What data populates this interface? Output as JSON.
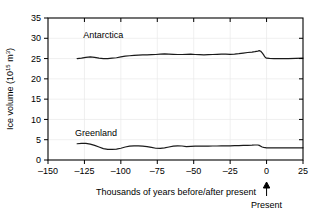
{
  "chart_data": {
    "type": "line",
    "title": "",
    "subtitle": "",
    "xlabel": "Thousands of years before/after present",
    "ylabel_prefix": "Ice volume (10",
    "ylabel_exponent": "15",
    "ylabel_suffix": " m",
    "ylabel_unit_exponent": "3",
    "ylabel_close": ")",
    "ylabel_full": "Ice volume (10^15 m^3)",
    "xlim": [
      -150,
      25
    ],
    "ylim": [
      0,
      35
    ],
    "xticks": [
      -150,
      -125,
      -100,
      -75,
      -50,
      -25,
      0,
      25
    ],
    "xtick_labels": [
      "–150",
      "–125",
      "–100",
      "–75",
      "–50",
      "–25",
      "0",
      "25"
    ],
    "yticks": [
      0,
      5,
      10,
      15,
      20,
      25,
      30,
      35
    ],
    "ytick_labels": [
      "0",
      "5",
      "10",
      "15",
      "20",
      "25",
      "30",
      "35"
    ],
    "grid": true,
    "grid_color": "#e8e8e8",
    "legend_position": "inline-labels",
    "line_color": "#1a1a1a",
    "annotations": [
      {
        "name": "present-marker",
        "label": "Present",
        "x": 0,
        "type": "up-arrow-below-axis"
      }
    ],
    "series": [
      {
        "name": "Antarctica",
        "label": "Antarctica",
        "label_x": -112,
        "label_y": 30,
        "x": [
          -130,
          -127,
          -124,
          -121,
          -118,
          -115,
          -112,
          -109,
          -106,
          -103,
          -100,
          -97,
          -94,
          -91,
          -88,
          -85,
          -82,
          -79,
          -76,
          -73,
          -70,
          -67,
          -64,
          -61,
          -58,
          -55,
          -52,
          -49,
          -46,
          -43,
          -40,
          -37,
          -34,
          -31,
          -28,
          -25,
          -22,
          -19,
          -16,
          -13,
          -10,
          -8,
          -6,
          -5,
          -4,
          -3,
          -2,
          -1.5,
          -1,
          -0.5,
          0,
          2,
          5,
          10,
          15,
          20,
          25
        ],
        "y": [
          25.0,
          25.1,
          25.3,
          25.4,
          25.3,
          25.1,
          25.0,
          25.0,
          25.1,
          25.2,
          25.4,
          25.6,
          25.7,
          25.8,
          25.85,
          25.9,
          25.9,
          25.95,
          26.0,
          26.1,
          26.15,
          26.1,
          26.05,
          26.0,
          26.0,
          26.05,
          26.1,
          26.0,
          25.95,
          25.9,
          25.95,
          26.0,
          26.05,
          26.1,
          26.1,
          26.05,
          26.1,
          26.2,
          26.35,
          26.5,
          26.6,
          26.7,
          26.85,
          26.95,
          26.8,
          26.4,
          25.9,
          25.6,
          25.35,
          25.2,
          25.1,
          25.05,
          25.0,
          25.0,
          25.0,
          25.05,
          25.1
        ]
      },
      {
        "name": "Greenland",
        "label": "Greenland",
        "label_x": -117,
        "label_y": 6.0,
        "x": [
          -130,
          -127,
          -124,
          -121,
          -118,
          -115,
          -112,
          -109,
          -106,
          -103,
          -100,
          -97,
          -94,
          -91,
          -88,
          -85,
          -82,
          -79,
          -76,
          -73,
          -70,
          -67,
          -64,
          -61,
          -58,
          -55,
          -52,
          -49,
          -46,
          -43,
          -40,
          -37,
          -34,
          -31,
          -28,
          -25,
          -22,
          -19,
          -16,
          -13,
          -10,
          -8,
          -6,
          -5,
          -4,
          -3,
          -2,
          -1,
          0,
          3,
          6,
          10,
          15,
          20,
          25
        ],
        "y": [
          4.0,
          4.1,
          4.1,
          3.9,
          3.6,
          3.2,
          2.8,
          2.6,
          2.6,
          2.7,
          2.9,
          3.2,
          3.4,
          3.5,
          3.5,
          3.4,
          3.3,
          3.1,
          2.9,
          2.85,
          3.0,
          3.2,
          3.4,
          3.5,
          3.45,
          3.3,
          3.35,
          3.4,
          3.4,
          3.4,
          3.4,
          3.45,
          3.45,
          3.5,
          3.5,
          3.5,
          3.55,
          3.55,
          3.6,
          3.6,
          3.65,
          3.7,
          3.7,
          3.6,
          3.4,
          3.2,
          3.1,
          3.05,
          3.0,
          3.0,
          3.0,
          3.0,
          3.0,
          3.0,
          3.0
        ]
      }
    ]
  },
  "figure": {
    "background_color": "#ffffff",
    "frame_color": "#000000"
  }
}
